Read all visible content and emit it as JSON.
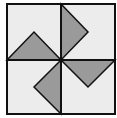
{
  "diagram": {
    "type": "pinwheel-quilt-block",
    "colors": {
      "background": "#ececec",
      "triangle_fill": "#9a9a9a",
      "stroke": "#111111"
    },
    "square": {
      "x": 7,
      "y": 4,
      "w": 108,
      "h": 110
    },
    "center": {
      "x": 61,
      "y": 60
    },
    "triangles": [
      {
        "name": "top",
        "points": "61,4 88,32 61,60"
      },
      {
        "name": "left",
        "points": "7,60 34,32 61,60"
      },
      {
        "name": "right",
        "points": "61,60 115,60 88,87"
      },
      {
        "name": "bottom",
        "points": "61,60 61,114 34,87"
      }
    ]
  }
}
